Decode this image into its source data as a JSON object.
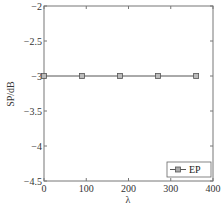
{
  "chart_data": {
    "type": "line",
    "title": "",
    "xlabel": "λ",
    "ylabel": "SP/dB",
    "xlim": [
      0,
      400
    ],
    "ylim": [
      -4.5,
      -2
    ],
    "xticks": [
      0,
      100,
      200,
      300,
      400
    ],
    "xtick_labels": [
      "0",
      "100",
      "200",
      "300",
      "400"
    ],
    "yticks": [
      -2,
      -2.5,
      -3,
      -3.5,
      -4,
      -4.5
    ],
    "ytick_labels": [
      "−2",
      "−2.5",
      "−3",
      "−3.5",
      "−4",
      "−4.5"
    ],
    "grid": false,
    "legend_position": "bottom-right",
    "series": [
      {
        "name": "EP",
        "marker": "square",
        "color": "#555555",
        "x": [
          0,
          90,
          180,
          270,
          360
        ],
        "y": [
          -3,
          -3,
          -3,
          -3,
          -3
        ]
      }
    ]
  }
}
